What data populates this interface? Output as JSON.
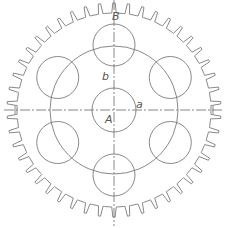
{
  "drawing": {
    "type": "spur gear technical drawing",
    "center": [
      114,
      110
    ],
    "stroke_color": "#7a7a7a",
    "centerline_color": "#6a6a6a",
    "gear": {
      "teeth": 46,
      "tip_radius": 107,
      "root_radius": 97
    },
    "bolt_circle": {
      "radius": 64
    },
    "hub_hole": {
      "radius": 22
    },
    "holes": {
      "count": 6,
      "pitch_radius": 65,
      "radius": 21,
      "start_angle_deg": 90
    },
    "centerlines": {
      "horizontal": {
        "y": 110,
        "x1": 4,
        "x2": 224
      },
      "vertical": {
        "x": 114,
        "y1": 0,
        "y2": 226
      }
    },
    "labels": [
      {
        "id": "B",
        "text": "B",
        "x": 112,
        "y": 20
      },
      {
        "id": "b",
        "text": "b",
        "x": 102,
        "y": 80
      },
      {
        "id": "a",
        "text": "a",
        "x": 136,
        "y": 108
      },
      {
        "id": "A",
        "text": "A",
        "x": 105,
        "y": 123
      }
    ]
  }
}
